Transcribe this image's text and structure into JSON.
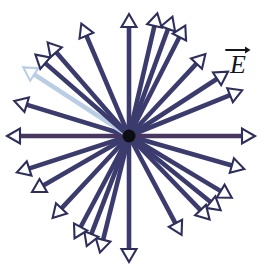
{
  "figure": {
    "width": 270,
    "height": 278,
    "background_color": "#ffffff"
  },
  "colors": {
    "line": "#3b3b6e",
    "line_dark": "#2e2e5c",
    "line_core_red": "#7a2a3a",
    "arrowhead_fill": "#ffffff",
    "arrowhead_stroke": "#2e2e5c",
    "charge_dot": "#0d0d12",
    "label_text": "#15151c",
    "tinted_arrow": "#b9cde4"
  },
  "charge": {
    "name": "point-charge",
    "cx": 129,
    "cy": 136,
    "r": 6.5
  },
  "label": {
    "symbol": "E",
    "icon": "vector-arrow-icon",
    "meaning": "electric-field-vector",
    "x": 221,
    "y": 42
  },
  "field_lines": {
    "count": 26,
    "stroke_width": 4.6,
    "arrow_head_length": 13,
    "arrow_head_half_width": 7.5,
    "rays": [
      {
        "angle_deg": 90,
        "length": 122,
        "tint": false
      },
      {
        "angle_deg": 77,
        "length": 126,
        "tint": false
      },
      {
        "angle_deg": 70,
        "length": 127,
        "tint": false
      },
      {
        "angle_deg": 63,
        "length": 124,
        "tint": false
      },
      {
        "angle_deg": 47,
        "length": 112,
        "tint": false
      },
      {
        "angle_deg": 33,
        "length": 118,
        "tint": false
      },
      {
        "angle_deg": 22,
        "length": 122,
        "tint": false
      },
      {
        "angle_deg": 0,
        "length": 126,
        "tint": false,
        "red_core": true
      },
      {
        "angle_deg": -16,
        "length": 120,
        "tint": false
      },
      {
        "angle_deg": -31,
        "length": 120,
        "tint": false
      },
      {
        "angle_deg": -39,
        "length": 118,
        "tint": false
      },
      {
        "angle_deg": -46,
        "length": 116,
        "tint": false
      },
      {
        "angle_deg": -62,
        "length": 112,
        "tint": false
      },
      {
        "angle_deg": -90,
        "length": 126,
        "tint": false
      },
      {
        "angle_deg": -104,
        "length": 120,
        "tint": false
      },
      {
        "angle_deg": -111,
        "length": 118,
        "tint": false
      },
      {
        "angle_deg": -118,
        "length": 116,
        "tint": false
      },
      {
        "angle_deg": -133,
        "length": 112,
        "tint": false
      },
      {
        "angle_deg": -150,
        "length": 112,
        "tint": false
      },
      {
        "angle_deg": -162,
        "length": 118,
        "tint": false
      },
      {
        "angle_deg": 180,
        "length": 122,
        "tint": false,
        "red_core": true
      },
      {
        "angle_deg": 163,
        "length": 120,
        "tint": false
      },
      {
        "angle_deg": 147,
        "length": 126,
        "tint": true
      },
      {
        "angle_deg": 139,
        "length": 124,
        "tint": false
      },
      {
        "angle_deg": 131,
        "length": 124,
        "tint": false
      },
      {
        "angle_deg": 113,
        "length": 122,
        "tint": false
      }
    ]
  },
  "chart_data": {
    "type": "scatter",
    "subtitle": "",
    "xlabel": "",
    "ylabel": "",
    "legend": [
      "E"
    ],
    "annotations": [
      "E"
    ],
    "grid": false,
    "center": {
      "x": 129,
      "y": 136
    },
    "series": [
      {
        "name": "field-line-angles-degrees",
        "values": [
          90,
          77,
          70,
          63,
          47,
          33,
          22,
          0,
          -16,
          -31,
          -39,
          -46,
          -62,
          -90,
          -104,
          -111,
          -118,
          -133,
          -150,
          -162,
          180,
          163,
          147,
          139,
          131,
          113
        ]
      },
      {
        "name": "field-line-lengths-pixels",
        "values": [
          122,
          126,
          127,
          124,
          112,
          118,
          122,
          126,
          120,
          120,
          118,
          116,
          112,
          126,
          120,
          118,
          116,
          112,
          112,
          118,
          122,
          120,
          126,
          124,
          124,
          122
        ]
      }
    ]
  }
}
